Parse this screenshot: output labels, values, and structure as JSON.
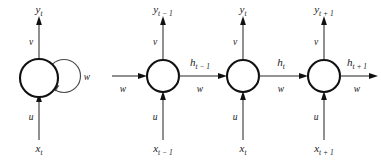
{
  "figure": {
    "background_color": "#ffffff",
    "line_color": "#2b2b2b",
    "node_stroke_color": "#111111",
    "node_fill_color": "#ffffff",
    "loop_color": "#4a4a4a"
  },
  "folded_unit": {
    "name": "folded-rnn-unit",
    "output_label": "y",
    "output_sub": "t",
    "input_label": "x",
    "input_sub": "t",
    "output_weight": "v",
    "input_weight": "u",
    "recurrent_weight": "w"
  },
  "unfolded_units": [
    {
      "name": "rnn-unit-t-minus-1",
      "output_label": "y",
      "output_sub": "t − 1",
      "input_label": "x",
      "input_sub": "t − 1",
      "output_weight": "v",
      "input_weight": "u",
      "hidden_label": "h",
      "hidden_sub": "t − 1",
      "recurrent_weight": "w",
      "incoming_weight": "w"
    },
    {
      "name": "rnn-unit-t",
      "output_label": "y",
      "output_sub": "t",
      "input_label": "x",
      "input_sub": "t",
      "output_weight": "v",
      "input_weight": "u",
      "hidden_label": "h",
      "hidden_sub": "t",
      "recurrent_weight": "w"
    },
    {
      "name": "rnn-unit-t-plus-1",
      "output_label": "y",
      "output_sub": "t + 1",
      "input_label": "x",
      "input_sub": "t + 1",
      "output_weight": "v",
      "input_weight": "u",
      "hidden_label": "h",
      "hidden_sub": "t + 1",
      "recurrent_weight": "w"
    }
  ]
}
